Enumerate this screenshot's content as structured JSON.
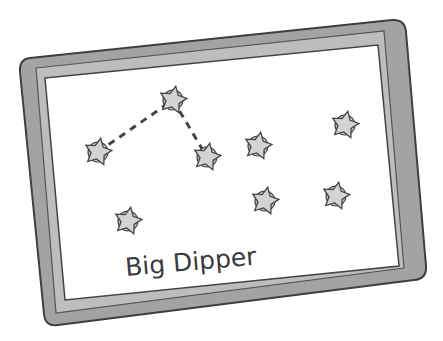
{
  "board": {
    "label": "Big Dipper",
    "frame_color": "#9a9a9a",
    "frame_edge_color": "#4a4a4a",
    "surface_color": "#ffffff",
    "star_fill": "#c8c8c8",
    "star_stroke": "#444444"
  },
  "stars": [
    {
      "id": 1,
      "x": 98,
      "y": 152,
      "connected": true
    },
    {
      "id": 2,
      "x": 173,
      "y": 100,
      "connected": true
    },
    {
      "id": 3,
      "x": 207,
      "y": 157,
      "connected": true
    },
    {
      "id": 4,
      "x": 258,
      "y": 146,
      "connected": false
    },
    {
      "id": 5,
      "x": 345,
      "y": 125,
      "connected": false
    },
    {
      "id": 6,
      "x": 128,
      "y": 221,
      "connected": false
    },
    {
      "id": 7,
      "x": 265,
      "y": 201,
      "connected": false
    },
    {
      "id": 8,
      "x": 336,
      "y": 196,
      "connected": false
    }
  ],
  "connections": [
    {
      "from": 1,
      "to": 2
    },
    {
      "from": 2,
      "to": 3
    }
  ]
}
